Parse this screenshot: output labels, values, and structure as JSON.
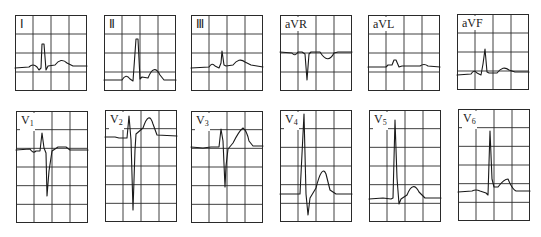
{
  "figure": {
    "line_color": "#1a1a1a",
    "grid_color": "#2a2a2a",
    "top_row": [
      {
        "lead": "I",
        "label": "Ⅰ",
        "x": 15,
        "y": 15,
        "w": 72,
        "h": 76,
        "rows": 4,
        "path": "M0,53 L14,52 Q18,48 22,52 L24,55 L26,53 L27,29 L29,29 L31,55 L33,51 L40,50 Q46,42 52,48 L58,51 L72,51"
      },
      {
        "lead": "II",
        "label": "Ⅱ",
        "x": 104,
        "y": 15,
        "w": 72,
        "h": 76,
        "rows": 4,
        "path": "M0,65 L18,65 Q22,58 26,64 L29,66 L32,24 L34,24 L36,64 L38,62 L44,63 Q50,48 56,60 L60,65 L72,65"
      },
      {
        "lead": "III",
        "label": "Ⅲ",
        "x": 191,
        "y": 15,
        "w": 72,
        "h": 76,
        "rows": 4,
        "path": "M0,53 L18,52 Q21,47 24,51 L28,53 L30,48 L31,36 L33,50 L35,51 L42,50 Q48,42 54,47 L60,50 L72,52"
      },
      {
        "lead": "aVR",
        "label": "aVR",
        "x": 280,
        "y": 15,
        "w": 72,
        "h": 76,
        "rows": 4,
        "path": "M0,37 L12,38 Q15,42 18,37 L22,37 L25,39 L27,65 L29,39 L31,37 L40,37 Q48,50 54,38 L58,37 L72,37"
      },
      {
        "lead": "aVL",
        "label": "aVL",
        "x": 368,
        "y": 15,
        "w": 72,
        "h": 76,
        "rows": 4,
        "path": "M0,52 L18,52 L20,50 L24,50 L26,45 L28,45 L31,52 L34,51 L52,51 Q56,48 60,51 L72,52"
      },
      {
        "lead": "aVF",
        "label": "aVF",
        "x": 457,
        "y": 14,
        "w": 72,
        "h": 76,
        "rows": 4,
        "path": "M0,61 L14,60 Q17,55 20,59 L24,61 L26,50 L28,35 L30,58 L32,59 L40,59 Q46,51 52,56 L58,58 L72,58"
      }
    ],
    "bottom_row": [
      {
        "lead": "V1",
        "label": "V",
        "sub": "1",
        "x": 16,
        "y": 111,
        "w": 72,
        "h": 112,
        "rows": 6,
        "path": "M0,39 L14,38 Q17,43 20,40 L24,40 L26,22 L28,37 L30,42 L31,85 L33,60 L36,40 L42,36 L50,36 L54,39 L72,39"
      },
      {
        "lead": "V2",
        "label": "V",
        "sub": "2",
        "x": 105,
        "y": 110,
        "w": 72,
        "h": 112,
        "rows": 6,
        "path": "M0,27 L10,27 L14,28 L22,28 L24,6 L26,30 L28,100 L30,40 L31,24 L38,18 Q44,0 48,14 L52,25 L72,26"
      },
      {
        "lead": "V3",
        "label": "V",
        "sub": "3",
        "x": 191,
        "y": 111,
        "w": 72,
        "h": 112,
        "rows": 6,
        "path": "M0,36 L12,37 L20,36 L28,36 L30,18 L32,30 L34,76 L35,55 L37,38 L42,32 Q48,20 52,17 Q56,20 58,30 L62,35 L72,35"
      },
      {
        "lead": "V4",
        "label": "V",
        "sub": "4",
        "x": 280,
        "y": 110,
        "w": 72,
        "h": 112,
        "rows": 6,
        "path": "M0,84 L10,84 L16,84 L20,84 L24,4 L26,84 L28,105 L30,88 L36,78 Q42,54 46,64 L50,80 L56,84 L72,84"
      },
      {
        "lead": "V5",
        "label": "V",
        "sub": "5",
        "x": 369,
        "y": 110,
        "w": 72,
        "h": 112,
        "rows": 6,
        "path": "M0,89 L14,88 L22,89 L24,88 L26,10 L28,68 L30,94 L32,89 L38,85 Q44,70 50,82 L56,88 L72,88"
      },
      {
        "lead": "V6",
        "label": "V",
        "sub": "6",
        "x": 458,
        "y": 109,
        "w": 72,
        "h": 112,
        "rows": 6,
        "path": "M0,83 L14,82 Q18,80 22,82 L28,84 L30,86 L32,22 L34,70 L36,78 L40,78 Q46,70 50,70 Q54,80 58,82 L72,82"
      }
    ]
  }
}
